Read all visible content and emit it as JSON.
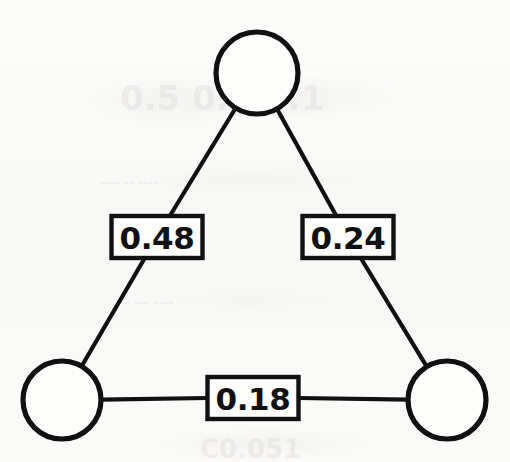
{
  "figure": {
    "background_color": "#fbfbfa",
    "stroke_color": "#111111",
    "fill_color": "#fdfdfc"
  },
  "chart_data": {
    "type": "diagram",
    "diagram_kind": "undirected weighted graph",
    "title": "",
    "nodes": [
      {
        "id": "top",
        "label": "",
        "cx": 257,
        "cy": 73,
        "r": 41
      },
      {
        "id": "bottom-left",
        "label": "",
        "cx": 62,
        "cy": 400,
        "r": 39
      },
      {
        "id": "bottom-right",
        "label": "",
        "cx": 447,
        "cy": 400,
        "r": 39
      }
    ],
    "edges": [
      {
        "id": "edge-left",
        "source": "top",
        "target": "bottom-left",
        "weight": 0.48,
        "label": "0.48",
        "label_x": 157,
        "label_y": 237
      },
      {
        "id": "edge-right",
        "source": "top",
        "target": "bottom-right",
        "weight": 0.24,
        "label": "0.24",
        "label_x": 348,
        "label_y": 237
      },
      {
        "id": "edge-bottom",
        "source": "bottom-left",
        "target": "bottom-right",
        "weight": 0.18,
        "label": "0.18",
        "label_x": 253,
        "label_y": 398
      }
    ],
    "label_box": {
      "width": 91,
      "height": 42
    },
    "legend": null,
    "grid": false,
    "axis": false
  },
  "background_artifacts": [
    {
      "id": "ghost-top",
      "text": "0.5 0.7 9.1",
      "x": 120,
      "y": 78,
      "size": 34
    },
    {
      "id": "ghost-mid",
      "text": "---- -- ----",
      "x": 100,
      "y": 176,
      "size": 12
    },
    {
      "id": "ghost-lower",
      "text": "-- --- ----",
      "x": 120,
      "y": 296,
      "size": 12
    },
    {
      "id": "ghost-bottom",
      "text": "C0.051",
      "x": 200,
      "y": 434,
      "size": 26
    }
  ]
}
